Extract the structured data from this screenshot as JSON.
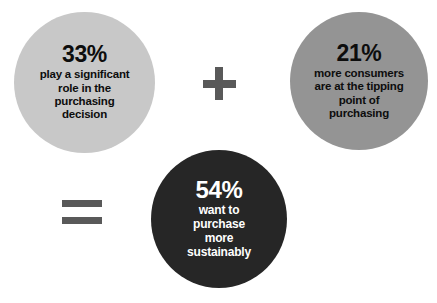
{
  "infographic": {
    "width": 437,
    "height": 303,
    "background_color": "#ffffff",
    "circles": [
      {
        "id": "role",
        "percent": "33%",
        "lines": [
          "play a significant",
          "role in the",
          "purchasing",
          "decision"
        ],
        "fill_color": "#c8c8c8",
        "text_color": "#0d0d0d"
      },
      {
        "id": "tipping",
        "percent": "21%",
        "lines": [
          "more consumers",
          "are at the tipping",
          "point of",
          "purchasing"
        ],
        "fill_color": "#949494",
        "text_color": "#0d0d0d"
      },
      {
        "id": "sustainably",
        "percent": "54%",
        "lines": [
          "want to",
          "purchase",
          "more",
          "sustainably"
        ],
        "fill_color": "#262626",
        "text_color": "#ffffff"
      }
    ],
    "operators": [
      {
        "id": "plus",
        "symbol": "+",
        "color": "#595959"
      },
      {
        "id": "equals",
        "symbol": "=",
        "color": "#595959"
      }
    ]
  },
  "chart_data": {
    "type": "pie",
    "title": "",
    "categories": [
      "play a significant role in the purchasing decision",
      "more consumers are at the tipping point of purchasing",
      "want to purchase more sustainably"
    ],
    "values": [
      33,
      21,
      54
    ],
    "value_labels": [
      "33%",
      "21%",
      "54%"
    ],
    "units": "percent",
    "relationship": "33% + 21% = 54%",
    "legend_position": "none",
    "grid": false
  }
}
